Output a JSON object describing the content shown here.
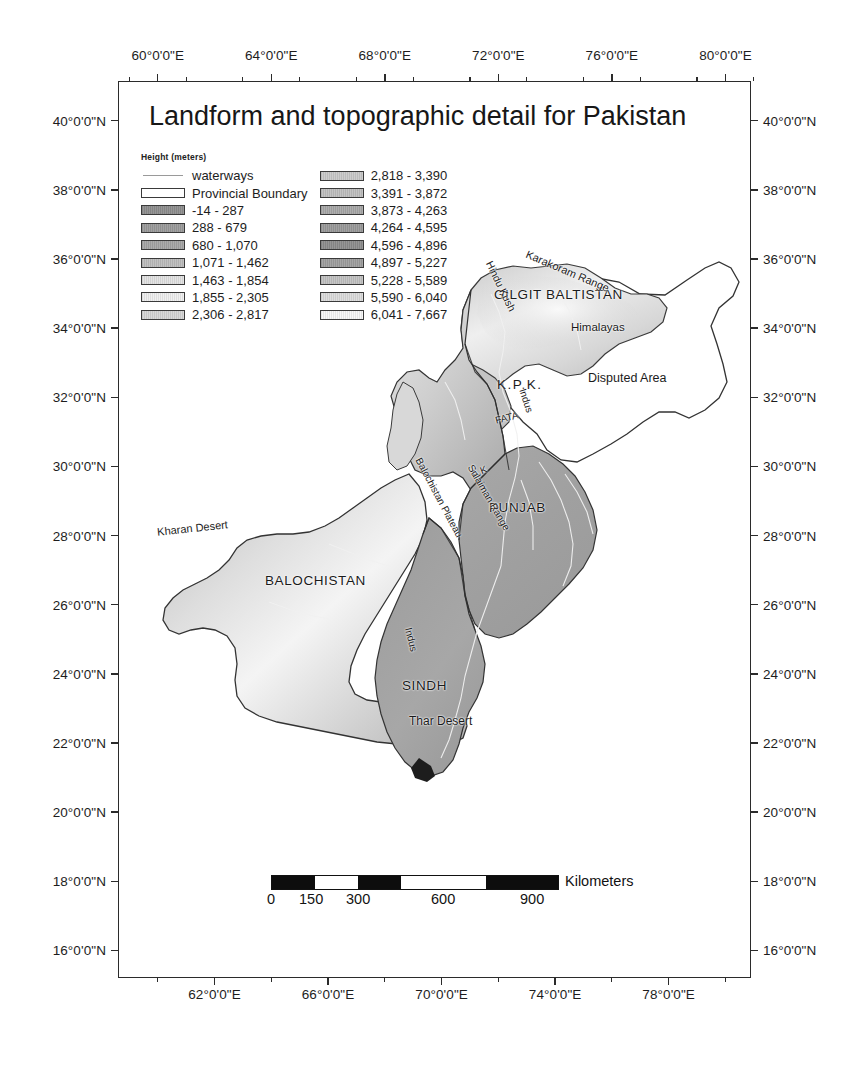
{
  "title": "Landform and topographic detail for Pakistan",
  "legend": {
    "heading": "Height (meters)",
    "column1": [
      {
        "label": "waterways",
        "type": "line",
        "color": "#9a9a9a"
      },
      {
        "label": "Provincial Boundary",
        "type": "outline",
        "color": "#ffffff"
      },
      {
        "label": "-14 - 287",
        "type": "fill",
        "color": "#8f8f8f"
      },
      {
        "label": "288 - 679",
        "type": "fill",
        "color": "#9b9b9b"
      },
      {
        "label": "680 - 1,070",
        "type": "fill",
        "color": "#a6a6a6"
      },
      {
        "label": "1,071 - 1,462",
        "type": "fill",
        "color": "#bdbdbd"
      },
      {
        "label": "1,463 - 1,854",
        "type": "fill",
        "color": "#e2e2e2"
      },
      {
        "label": "1,855 - 2,305",
        "type": "fill",
        "color": "#efefef"
      },
      {
        "label": "2,306 - 2,817",
        "type": "fill",
        "color": "#d5d5d5"
      }
    ],
    "column2": [
      {
        "label": "2,818 - 3,390",
        "type": "fill",
        "color": "#c9c9c9"
      },
      {
        "label": "3,391 - 3,872",
        "type": "fill",
        "color": "#bfbfbf"
      },
      {
        "label": "3,873 - 4,263",
        "type": "fill",
        "color": "#a8a8a8"
      },
      {
        "label": "4,264 - 4,595",
        "type": "fill",
        "color": "#9a9a9a"
      },
      {
        "label": "4,596 - 4,896",
        "type": "fill",
        "color": "#8e8e8e"
      },
      {
        "label": "4,897 - 5,227",
        "type": "fill",
        "color": "#9f9f9f"
      },
      {
        "label": "5,228 - 5,589",
        "type": "fill",
        "color": "#c2c2c2"
      },
      {
        "label": "5,590 - 6,040",
        "type": "fill",
        "color": "#dcdcdc"
      },
      {
        "label": "6,041 - 7,667",
        "type": "fill",
        "color": "#f6f6f6"
      }
    ]
  },
  "axes": {
    "top_labels": [
      "60°0'0\"E",
      "64°0'0\"E",
      "68°0'0\"E",
      "72°0'0\"E",
      "76°0'0\"E",
      "80°0'0\"E"
    ],
    "bottom_labels": [
      "62°0'0\"E",
      "66°0'0\"E",
      "70°0'0\"E",
      "74°0'0\"E",
      "78°0'0\"E"
    ],
    "left_labels": [
      "40°0'0\"N",
      "38°0'0\"N",
      "36°0'0\"N",
      "34°0'0\"N",
      "32°0'0\"N",
      "30°0'0\"N",
      "28°0'0\"N",
      "26°0'0\"N",
      "24°0'0\"N",
      "22°0'0\"N",
      "20°0'0\"N",
      "18°0'0\"N",
      "16°0'0\"N"
    ],
    "right_labels": [
      "40°0'0\"N",
      "38°0'0\"N",
      "36°0'0\"N",
      "34°0'0\"N",
      "32°0'0\"N",
      "30°0'0\"N",
      "28°0'0\"N",
      "26°0'0\"N",
      "24°0'0\"N",
      "22°0'0\"N",
      "20°0'0\"N",
      "18°0'0\"N",
      "16°0'0\"N"
    ]
  },
  "map_labels": {
    "provinces": [
      {
        "name": "GILGIT BALTISTAN"
      },
      {
        "name": "K.P.K."
      },
      {
        "name": "PUNJAB"
      },
      {
        "name": "BALOCHISTAN"
      },
      {
        "name": "SINDH"
      },
      {
        "name": "FATA"
      },
      {
        "name": "A.K"
      }
    ],
    "features": [
      {
        "name": "Karakoram Range"
      },
      {
        "name": "Hindu Kush"
      },
      {
        "name": "Himalayas"
      },
      {
        "name": "Disputed Area"
      },
      {
        "name": "Indus"
      },
      {
        "name": "Balochistan Plateau"
      },
      {
        "name": "Sulaiman Range"
      },
      {
        "name": "Kharan Desert"
      },
      {
        "name": "Thar Desert"
      }
    ]
  },
  "scalebar": {
    "unit": "Kilometers",
    "ticks": [
      "0",
      "150",
      "300",
      "600",
      "900"
    ]
  }
}
